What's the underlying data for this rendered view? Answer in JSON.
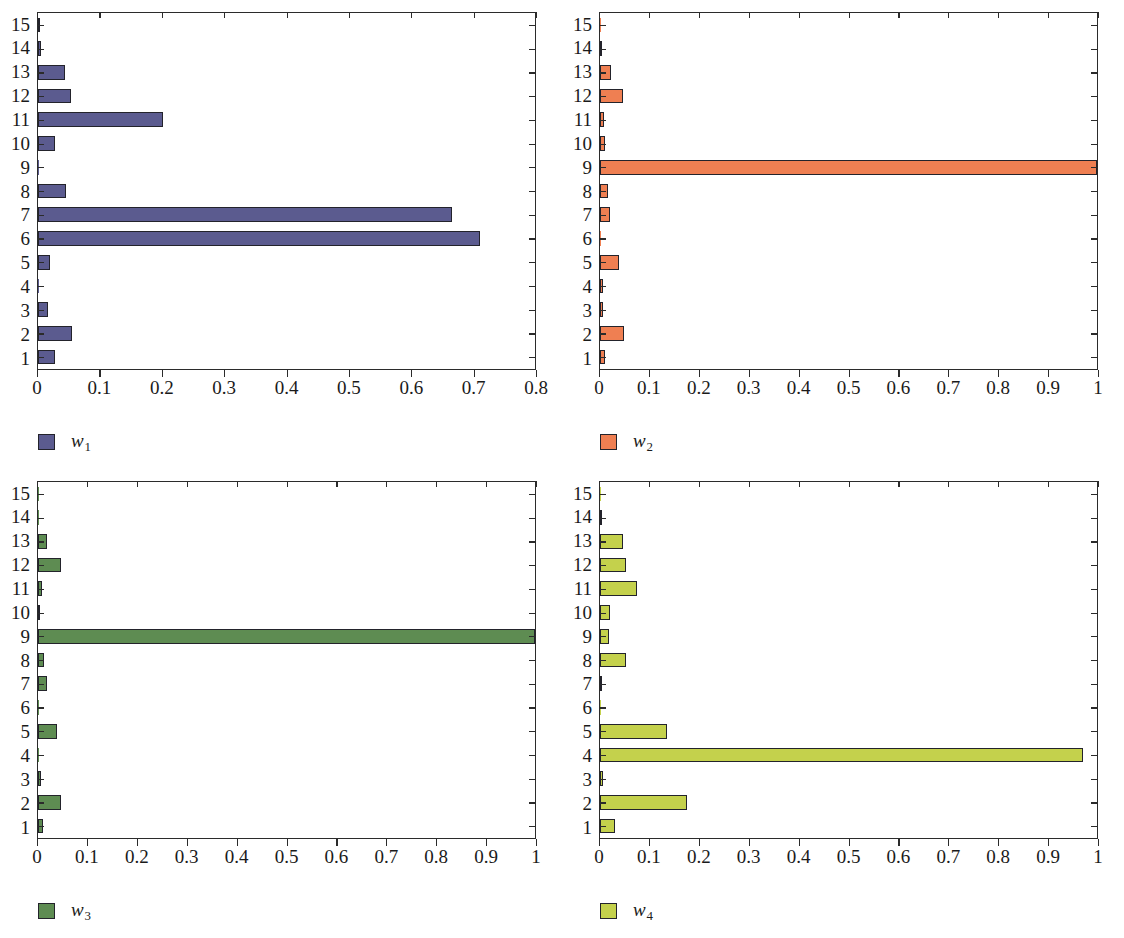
{
  "figure": {
    "panel_count": 4
  },
  "panels": [
    {
      "id": "panel-w1",
      "legend_label": "w",
      "legend_sub": "1",
      "color": "#5b5b8f",
      "border_color": "#23232b",
      "xlim": [
        0,
        0.8
      ],
      "xticks": [
        0,
        0.1,
        0.2,
        0.3,
        0.4,
        0.5,
        0.6,
        0.7,
        0.8
      ],
      "xtick_labels": [
        "0",
        "0.1",
        "0.2",
        "0.3",
        "0.4",
        "0.5",
        "0.6",
        "0.7",
        "0.8"
      ],
      "categories": [
        "1",
        "2",
        "3",
        "4",
        "5",
        "6",
        "7",
        "8",
        "9",
        "10",
        "11",
        "12",
        "13",
        "14",
        "15"
      ],
      "values": [
        0.028,
        0.055,
        0.016,
        0.001,
        0.02,
        0.708,
        0.663,
        0.045,
        0.001,
        0.027,
        0.2,
        0.053,
        0.043,
        0.005,
        0.002
      ]
    },
    {
      "id": "panel-w2",
      "legend_label": "w",
      "legend_sub": "2",
      "color": "#ef7f52",
      "border_color": "#23232b",
      "xlim": [
        0,
        1
      ],
      "xticks": [
        0,
        0.1,
        0.2,
        0.3,
        0.4,
        0.5,
        0.6,
        0.7,
        0.8,
        0.9,
        1
      ],
      "xtick_labels": [
        "0",
        "0.1",
        "0.2",
        "0.3",
        "0.4",
        "0.5",
        "0.6",
        "0.7",
        "0.8",
        "0.9",
        "1"
      ],
      "categories": [
        "1",
        "2",
        "3",
        "4",
        "5",
        "6",
        "7",
        "8",
        "9",
        "10",
        "11",
        "12",
        "13",
        "14",
        "15"
      ],
      "values": [
        0.01,
        0.048,
        0.007,
        0.007,
        0.038,
        0.001,
        0.02,
        0.016,
        1.0,
        0.01,
        0.009,
        0.047,
        0.022,
        0.003,
        0.001
      ]
    },
    {
      "id": "panel-w3",
      "legend_label": "w",
      "legend_sub": "3",
      "color": "#5e8c52",
      "border_color": "#23232b",
      "xlim": [
        0,
        1
      ],
      "xticks": [
        0,
        0.1,
        0.2,
        0.3,
        0.4,
        0.5,
        0.6,
        0.7,
        0.8,
        0.9,
        1
      ],
      "xtick_labels": [
        "0",
        "0.1",
        "0.2",
        "0.3",
        "0.4",
        "0.5",
        "0.6",
        "0.7",
        "0.8",
        "0.9",
        "1"
      ],
      "categories": [
        "1",
        "2",
        "3",
        "4",
        "5",
        "6",
        "7",
        "8",
        "9",
        "10",
        "11",
        "12",
        "13",
        "14",
        "15"
      ],
      "values": [
        0.01,
        0.047,
        0.007,
        0.002,
        0.038,
        0.001,
        0.018,
        0.013,
        1.0,
        0.003,
        0.008,
        0.047,
        0.019,
        0.002,
        0.001
      ]
    },
    {
      "id": "panel-w4",
      "legend_label": "w",
      "legend_sub": "4",
      "color": "#c4d14c",
      "border_color": "#23232b",
      "xlim": [
        0,
        1
      ],
      "xticks": [
        0,
        0.1,
        0.2,
        0.3,
        0.4,
        0.5,
        0.6,
        0.7,
        0.8,
        0.9,
        1
      ],
      "xtick_labels": [
        "0",
        "0.1",
        "0.2",
        "0.3",
        "0.4",
        "0.5",
        "0.6",
        "0.7",
        "0.8",
        "0.9",
        "1"
      ],
      "categories": [
        "1",
        "2",
        "3",
        "4",
        "5",
        "6",
        "7",
        "8",
        "9",
        "10",
        "11",
        "12",
        "13",
        "14",
        "15"
      ],
      "values": [
        0.03,
        0.175,
        0.006,
        0.968,
        0.135,
        0.001,
        0.004,
        0.052,
        0.018,
        0.021,
        0.075,
        0.053,
        0.047,
        0.004,
        0.002
      ]
    }
  ],
  "chart_data": [
    {
      "type": "bar",
      "orientation": "horizontal",
      "title": "",
      "subtitle": "",
      "xlabel": "",
      "ylabel": "",
      "legend": [
        "w1"
      ],
      "legend_position": "below-left",
      "grid": false,
      "xlim": [
        0,
        0.8
      ],
      "ylim": [
        0.5,
        15.5
      ],
      "xticks": [
        0,
        0.1,
        0.2,
        0.3,
        0.4,
        0.5,
        0.6,
        0.7,
        0.8
      ],
      "xtick_labels": [
        "0",
        "0.1",
        "0.2",
        "0.3",
        "0.4",
        "0.5",
        "0.6",
        "0.7",
        "0.8"
      ],
      "categories": [
        "1",
        "2",
        "3",
        "4",
        "5",
        "6",
        "7",
        "8",
        "9",
        "10",
        "11",
        "12",
        "13",
        "14",
        "15"
      ],
      "values": [
        0.028,
        0.055,
        0.016,
        0.001,
        0.02,
        0.708,
        0.663,
        0.045,
        0.001,
        0.027,
        0.2,
        0.053,
        0.043,
        0.005,
        0.002
      ],
      "color": "#5b5b8f"
    },
    {
      "type": "bar",
      "orientation": "horizontal",
      "title": "",
      "subtitle": "",
      "xlabel": "",
      "ylabel": "",
      "legend": [
        "w2"
      ],
      "legend_position": "below-left",
      "grid": false,
      "xlim": [
        0,
        1
      ],
      "ylim": [
        0.5,
        15.5
      ],
      "xticks": [
        0,
        0.1,
        0.2,
        0.3,
        0.4,
        0.5,
        0.6,
        0.7,
        0.8,
        0.9,
        1
      ],
      "xtick_labels": [
        "0",
        "0.1",
        "0.2",
        "0.3",
        "0.4",
        "0.5",
        "0.6",
        "0.7",
        "0.8",
        "0.9",
        "1"
      ],
      "categories": [
        "1",
        "2",
        "3",
        "4",
        "5",
        "6",
        "7",
        "8",
        "9",
        "10",
        "11",
        "12",
        "13",
        "14",
        "15"
      ],
      "values": [
        0.01,
        0.048,
        0.007,
        0.007,
        0.038,
        0.001,
        0.02,
        0.016,
        1.0,
        0.01,
        0.009,
        0.047,
        0.022,
        0.003,
        0.001
      ],
      "color": "#ef7f52"
    },
    {
      "type": "bar",
      "orientation": "horizontal",
      "title": "",
      "subtitle": "",
      "xlabel": "",
      "ylabel": "",
      "legend": [
        "w3"
      ],
      "legend_position": "below-left",
      "grid": false,
      "xlim": [
        0,
        1
      ],
      "ylim": [
        0.5,
        15.5
      ],
      "xticks": [
        0,
        0.1,
        0.2,
        0.3,
        0.4,
        0.5,
        0.6,
        0.7,
        0.8,
        0.9,
        1
      ],
      "xtick_labels": [
        "0",
        "0.1",
        "0.2",
        "0.3",
        "0.4",
        "0.5",
        "0.6",
        "0.7",
        "0.8",
        "0.9",
        "1"
      ],
      "categories": [
        "1",
        "2",
        "3",
        "4",
        "5",
        "6",
        "7",
        "8",
        "9",
        "10",
        "11",
        "12",
        "13",
        "14",
        "15"
      ],
      "values": [
        0.01,
        0.047,
        0.007,
        0.002,
        0.038,
        0.001,
        0.018,
        0.013,
        1.0,
        0.003,
        0.008,
        0.047,
        0.019,
        0.002,
        0.001
      ],
      "color": "#5e8c52"
    },
    {
      "type": "bar",
      "orientation": "horizontal",
      "title": "",
      "subtitle": "",
      "xlabel": "",
      "ylabel": "",
      "legend": [
        "w4"
      ],
      "legend_position": "below-left",
      "grid": false,
      "xlim": [
        0,
        1
      ],
      "ylim": [
        0.5,
        15.5
      ],
      "xticks": [
        0,
        0.1,
        0.2,
        0.3,
        0.4,
        0.5,
        0.6,
        0.7,
        0.8,
        0.9,
        1
      ],
      "xtick_labels": [
        "0",
        "0.1",
        "0.2",
        "0.3",
        "0.4",
        "0.5",
        "0.6",
        "0.7",
        "0.8",
        "0.9",
        "1"
      ],
      "categories": [
        "1",
        "2",
        "3",
        "4",
        "5",
        "6",
        "7",
        "8",
        "9",
        "10",
        "11",
        "12",
        "13",
        "14",
        "15"
      ],
      "values": [
        0.03,
        0.175,
        0.006,
        0.968,
        0.135,
        0.001,
        0.004,
        0.052,
        0.018,
        0.021,
        0.075,
        0.053,
        0.047,
        0.004,
        0.002
      ],
      "color": "#c4d14c"
    }
  ]
}
